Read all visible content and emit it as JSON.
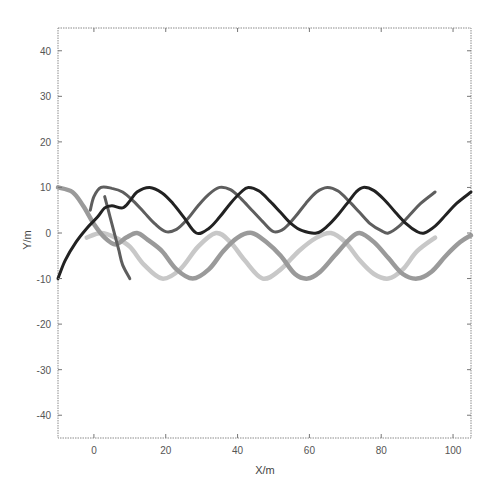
{
  "chart_data": {
    "type": "line",
    "title": "",
    "xlabel": "X/m",
    "ylabel": "Y/m",
    "xlim": [
      -10,
      105
    ],
    "ylim": [
      -45,
      45
    ],
    "xticks": [
      0,
      20,
      40,
      60,
      80,
      100
    ],
    "yticks": [
      40,
      30,
      20,
      10,
      0,
      -10,
      -20,
      -30,
      -40
    ],
    "grid": false,
    "legend": null,
    "series": [
      {
        "name": "trajectory-light-gray",
        "color": "#c8c8c8",
        "width": 4.5,
        "points": [
          [
            -2,
            -1
          ],
          [
            2,
            0
          ],
          [
            6,
            -1
          ],
          [
            10,
            -3
          ],
          [
            14,
            -7
          ],
          [
            19,
            -10
          ],
          [
            24,
            -8
          ],
          [
            29,
            -3
          ],
          [
            34,
            0
          ],
          [
            38,
            -2
          ],
          [
            42,
            -6
          ],
          [
            47,
            -10
          ],
          [
            52,
            -8
          ],
          [
            57,
            -4
          ],
          [
            62,
            -1
          ],
          [
            66,
            0
          ],
          [
            70,
            -2
          ],
          [
            74,
            -6
          ],
          [
            78,
            -9
          ],
          [
            82,
            -10
          ],
          [
            86,
            -8
          ],
          [
            90,
            -4
          ],
          [
            95,
            -1
          ]
        ]
      },
      {
        "name": "trajectory-mid-gray",
        "color": "#9a9a9a",
        "width": 4.5,
        "points": [
          [
            -10,
            10
          ],
          [
            -6,
            9
          ],
          [
            -3,
            6
          ],
          [
            0,
            2
          ],
          [
            3,
            -1
          ],
          [
            6,
            -2.5
          ],
          [
            9,
            -1
          ],
          [
            12,
            0
          ],
          [
            15,
            -1.5
          ],
          [
            19,
            -4
          ],
          [
            23,
            -8
          ],
          [
            27.5,
            -10
          ],
          [
            32,
            -8
          ],
          [
            36,
            -4
          ],
          [
            40,
            -1
          ],
          [
            44,
            0
          ],
          [
            48,
            -2
          ],
          [
            52,
            -5
          ],
          [
            56,
            -9
          ],
          [
            59.5,
            -10
          ],
          [
            63,
            -8.5
          ],
          [
            67,
            -5
          ],
          [
            71,
            -1.5
          ],
          [
            74,
            0
          ],
          [
            78,
            -2
          ],
          [
            82,
            -5.5
          ],
          [
            86,
            -9
          ],
          [
            90,
            -10
          ],
          [
            94,
            -8.5
          ],
          [
            98,
            -5
          ],
          [
            102,
            -2
          ],
          [
            105,
            -0.5
          ]
        ]
      },
      {
        "name": "trajectory-dark-gray",
        "color": "#5e5e5e",
        "width": 3,
        "points": [
          [
            -1,
            5
          ],
          [
            0,
            8
          ],
          [
            2,
            10
          ],
          [
            5,
            9.8
          ],
          [
            8,
            9
          ],
          [
            11,
            7
          ],
          [
            14,
            4.5
          ],
          [
            17,
            2
          ],
          [
            20,
            0.3
          ],
          [
            23,
            0.8
          ],
          [
            26,
            3
          ],
          [
            29,
            6
          ],
          [
            32,
            8.5
          ],
          [
            35,
            10
          ],
          [
            38,
            9.5
          ],
          [
            41,
            7.5
          ],
          [
            44,
            5
          ],
          [
            47,
            2.5
          ],
          [
            50,
            0.3
          ],
          [
            53,
            1
          ],
          [
            56,
            3.5
          ],
          [
            59,
            6.5
          ],
          [
            62,
            9
          ],
          [
            65,
            10
          ],
          [
            68,
            9.2
          ],
          [
            71,
            7
          ],
          [
            74,
            4.5
          ],
          [
            77,
            2
          ],
          [
            80,
            0.5
          ],
          [
            82,
            0
          ],
          [
            85,
            1.5
          ],
          [
            88,
            4
          ],
          [
            91,
            6.5
          ],
          [
            95,
            9
          ]
        ]
      },
      {
        "name": "trajectory-dark-gray-branch",
        "color": "#5e5e5e",
        "width": 3,
        "points": [
          [
            3,
            8
          ],
          [
            4,
            5
          ],
          [
            5,
            2
          ],
          [
            6,
            -1
          ],
          [
            7,
            -4
          ],
          [
            8,
            -7
          ],
          [
            10,
            -10
          ]
        ]
      },
      {
        "name": "trajectory-black",
        "color": "#222222",
        "width": 3,
        "points": [
          [
            -10,
            -10
          ],
          [
            -8,
            -6
          ],
          [
            -5,
            -2
          ],
          [
            -2,
            1
          ],
          [
            1,
            3.5
          ],
          [
            3,
            5.5
          ],
          [
            5,
            6
          ],
          [
            8,
            5.5
          ],
          [
            10,
            7
          ],
          [
            12,
            9
          ],
          [
            15.5,
            10
          ],
          [
            19,
            8.8
          ],
          [
            22,
            6.5
          ],
          [
            25,
            3.5
          ],
          [
            28.5,
            0
          ],
          [
            32,
            1
          ],
          [
            35,
            3.5
          ],
          [
            38,
            6.5
          ],
          [
            41,
            9
          ],
          [
            43,
            10
          ],
          [
            46,
            9.2
          ],
          [
            49,
            7
          ],
          [
            52,
            4.5
          ],
          [
            55,
            2
          ],
          [
            58,
            0.5
          ],
          [
            62,
            0
          ],
          [
            65,
            1.5
          ],
          [
            68,
            4
          ],
          [
            71,
            7
          ],
          [
            73,
            9
          ],
          [
            75,
            10
          ],
          [
            78,
            9.3
          ],
          [
            81,
            7.2
          ],
          [
            84,
            4.5
          ],
          [
            87,
            2
          ],
          [
            90,
            0.3
          ],
          [
            92,
            0
          ],
          [
            95,
            1.5
          ],
          [
            98,
            4
          ],
          [
            101,
            6.5
          ],
          [
            105,
            9
          ]
        ]
      }
    ]
  }
}
